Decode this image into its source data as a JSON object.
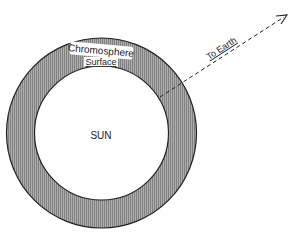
{
  "diagram": {
    "sun_label": "SUN",
    "chromosphere_label": "Chromosphere",
    "surface_label": "Surface",
    "earth_label": "To Earth",
    "colors": {
      "ring_fill": "#a8a8a8",
      "ring_stripe": "#7a7a7a",
      "outline": "#222222",
      "background": "#ffffff"
    }
  }
}
